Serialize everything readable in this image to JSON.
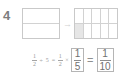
{
  "item": {
    "number": "4"
  },
  "model": {
    "left_figure": {
      "name": "half-rectangle-model",
      "rows": 2,
      "columns": 1,
      "shaded_cells": 0
    },
    "arrow": {
      "glyph": "→"
    },
    "right_figure": {
      "name": "tenths-grid-model",
      "rows": 2,
      "columns": 5,
      "shaded_cells": 1
    }
  },
  "equation": {
    "term1": {
      "numerator": "1",
      "denominator": "2"
    },
    "op1": "÷",
    "divisor": "5",
    "op2": "=",
    "term2": {
      "numerator": "1",
      "denominator": "2"
    },
    "op3": "×",
    "answer1": {
      "numerator": "1",
      "denominator": "5"
    },
    "op4": "=",
    "answer2": {
      "numerator": "1",
      "denominator": "10"
    }
  },
  "colors": {
    "text": "#8a8a8a",
    "line": "#c9c9c9",
    "shade": "#e6e6e6",
    "box_border": "#b5b5b5"
  }
}
